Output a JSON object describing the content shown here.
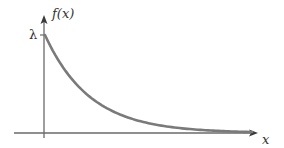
{
  "chart_data": {
    "type": "line",
    "title": "",
    "xlabel": "x",
    "ylabel": "f(x)",
    "y_tick_labels": [
      "λ"
    ],
    "x": [
      0,
      0.5,
      1,
      1.5,
      2,
      2.5,
      3,
      3.5,
      4,
      4.5,
      5
    ],
    "series": [
      {
        "name": "f(x)",
        "values": [
          1.0,
          0.61,
          0.37,
          0.22,
          0.14,
          0.08,
          0.05,
          0.03,
          0.02,
          0.01,
          0.007
        ]
      }
    ],
    "ylim": [
      0,
      1.1
    ],
    "xlim": [
      -0.6,
      5.6
    ],
    "grid": false,
    "legend": null,
    "colors": {
      "curve": "#7a7a7a",
      "axes": "#5a5a5a",
      "text": "#333333"
    }
  },
  "labels": {
    "y_axis": "f(x)",
    "x_axis": "x",
    "y_intercept": "λ"
  }
}
